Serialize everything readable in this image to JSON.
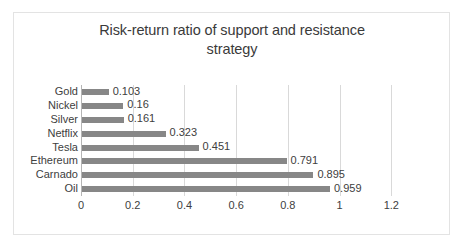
{
  "chart_data": {
    "type": "bar",
    "orientation": "horizontal",
    "title": "Risk-return ratio of support and resistance strategy",
    "title_line1": "Risk-return ratio of support and resistance",
    "title_line2": "strategy",
    "xlabel": "",
    "ylabel": "",
    "categories": [
      "Gold",
      "Nickel",
      "Silver",
      "Netflix",
      "Tesla",
      "Ethereum",
      "Carnado",
      "Oil"
    ],
    "values": [
      0.103,
      0.16,
      0.161,
      0.323,
      0.451,
      0.791,
      0.895,
      0.959
    ],
    "value_labels": [
      "0.103",
      "0.16",
      "0.161",
      "0.323",
      "0.451",
      "0.791",
      "0.895",
      "0.959"
    ],
    "xlim": [
      0,
      1.4
    ],
    "xticks": [
      0,
      0.2,
      0.4,
      0.6,
      0.8,
      1,
      1.2
    ],
    "xtick_labels": [
      "0",
      "0.2",
      "0.4",
      "0.6",
      "0.8",
      "1",
      "1.2"
    ],
    "grid": "vertical",
    "legend": "none",
    "series_color": "#878787",
    "gridline_color": "#d9d9d9",
    "text_color": "#404040",
    "background_color": "#ffffff",
    "border_color": "#e3e3e3"
  }
}
